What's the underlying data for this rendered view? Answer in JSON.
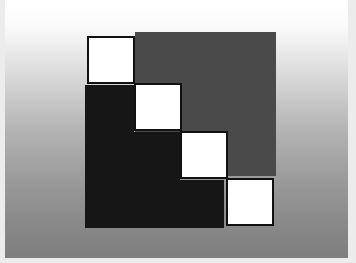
{
  "figure": {
    "colors": {
      "upper_region": "#4a4a4a",
      "lower_region": "#161616",
      "diagonal_squares": "#ffffff",
      "square_border": "#111111"
    },
    "diagonal_square_count": 4
  }
}
